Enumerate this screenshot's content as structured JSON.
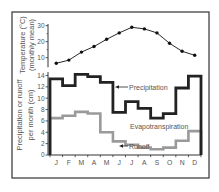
{
  "chart_data": [
    {
      "type": "line",
      "title": "",
      "ylabel": "Temperature (°C) (monthly mean)",
      "ylabel_lines": [
        "Temperature (°C)",
        "(monthly mean)"
      ],
      "xlabel": "",
      "categories": [
        "J",
        "F",
        "M",
        "A",
        "M",
        "J",
        "J",
        "A",
        "S",
        "O",
        "N",
        "D"
      ],
      "series": [
        {
          "name": "Temperature",
          "values": [
            6.5,
            8.5,
            13.5,
            17,
            21.5,
            25.5,
            29,
            28,
            25.5,
            19,
            14,
            11.5
          ]
        }
      ],
      "ylim": [
        0,
        30
      ],
      "yticks": [
        10,
        20,
        30
      ],
      "grid": false,
      "markers": "filled-circle"
    },
    {
      "type": "line",
      "subtype": "step",
      "title": "",
      "ylabel": "Precipitation or runoff per month (cm)",
      "ylabel_lines": [
        "Precipitation or runoff",
        "per month (cm)"
      ],
      "xlabel": "",
      "categories": [
        "J",
        "F",
        "M",
        "A",
        "M",
        "J",
        "J",
        "A",
        "S",
        "O",
        "N",
        "D"
      ],
      "series": [
        {
          "name": "Precipitation",
          "color": "#222222",
          "values": [
            13.4,
            12.2,
            14.2,
            13.8,
            12.8,
            7.5,
            9.4,
            8.2,
            6.5,
            7.3,
            11.8,
            13.9
          ]
        },
        {
          "name": "Runoff",
          "color": "#9a9a9a",
          "values": [
            6.5,
            6.9,
            7.6,
            7.3,
            4.0,
            2.4,
            1.8,
            1.3,
            1.0,
            1.3,
            2.5,
            4.2
          ]
        }
      ],
      "annotations": [
        "Precipitation",
        "Evapotranspiration",
        "Runoff"
      ],
      "ylim": [
        0,
        14
      ],
      "yticks": [
        0,
        2,
        4,
        6,
        8,
        10,
        12,
        14
      ],
      "grid": false
    }
  ],
  "labels": {
    "temp_axis_line1": "Temperature (°C)",
    "temp_axis_line2": "(monthly mean)",
    "precip_axis_line1": "Precipitation or runoff",
    "precip_axis_line2": "per month (cm)",
    "precipitation": "Precipitation",
    "evapotranspiration": "Evapotranspiration",
    "runoff": "Runoff"
  },
  "colors": {
    "frame": "#333333",
    "axis": "#333333",
    "text": "#555555",
    "temperature": "#111111",
    "precipitation": "#222222",
    "runoff": "#9a9a9a"
  }
}
